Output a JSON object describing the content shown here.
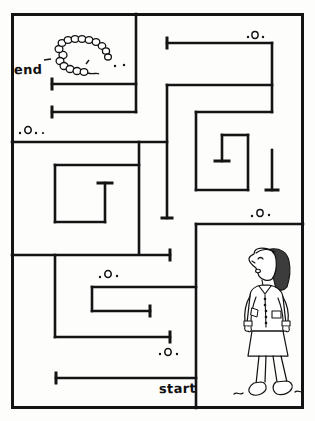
{
  "puzzle": {
    "type": "maze",
    "title": "Maze puzzle with girl and caterpillar",
    "labels": {
      "start": "start",
      "end": "end"
    },
    "colors": {
      "ink": "#141414",
      "paper": "#fdfdfc",
      "wall": "#111111"
    },
    "frame": {
      "x": 11,
      "y": 13,
      "width": 292,
      "height": 395,
      "stroke": 3
    },
    "figures": [
      {
        "name": "caterpillar",
        "description": "caterpillar drawn as a chain of small circles, top-left cell"
      },
      {
        "name": "girl",
        "description": "girl in jacket and skirt looking upward, bottom-right cell"
      }
    ],
    "pebbles": [
      {
        "name": "pebble-top-right",
        "x": 248,
        "y": 38,
        "glyph": ".o."
      },
      {
        "name": "pebble-left-upper",
        "x": 18,
        "y": 131,
        "glyph": ".o.."
      },
      {
        "name": "pebble-right-middle",
        "x": 248,
        "y": 215,
        "glyph": ".o."
      },
      {
        "name": "pebble-center-lower",
        "x": 97,
        "y": 274,
        "glyph": ".o."
      },
      {
        "name": "pebble-bottom-center",
        "x": 157,
        "y": 352,
        "glyph": ".o."
      },
      {
        "name": "pebble-caterpillar-trail",
        "x": 110,
        "y": 57,
        "glyph": ". ."
      }
    ],
    "walls": {
      "horizontal": [
        {
          "x1": 52,
          "x2": 136,
          "y": 84
        },
        {
          "x1": 136,
          "x2": 167,
          "y": 84
        },
        {
          "x1": 52,
          "x2": 136,
          "y": 112
        },
        {
          "x1": 11,
          "x2": 167,
          "y": 142
        },
        {
          "x1": 167,
          "x2": 272,
          "y": 43
        },
        {
          "x1": 167,
          "x2": 272,
          "y": 85
        },
        {
          "x1": 196,
          "x2": 272,
          "y": 112
        },
        {
          "x1": 196,
          "x2": 248,
          "y": 190
        },
        {
          "x1": 55,
          "x2": 105,
          "y": 165
        },
        {
          "x1": 55,
          "x2": 105,
          "y": 222
        },
        {
          "x1": 11,
          "x2": 170,
          "y": 255
        },
        {
          "x1": 196,
          "x2": 303,
          "y": 224
        },
        {
          "x1": 92,
          "x2": 196,
          "y": 287
        },
        {
          "x1": 92,
          "x2": 150,
          "y": 311
        },
        {
          "x1": 55,
          "x2": 170,
          "y": 337
        },
        {
          "x1": 44,
          "x2": 196,
          "y": 378
        }
      ],
      "vertical": [
        {
          "y1": 13,
          "y2": 84,
          "x": 136
        },
        {
          "y1": 13,
          "y2": 112,
          "x": 136
        },
        {
          "y1": 85,
          "y2": 142,
          "x": 167
        },
        {
          "y1": 142,
          "y2": 222,
          "x": 167
        },
        {
          "y1": 43,
          "y2": 112,
          "x": 272
        },
        {
          "y1": 112,
          "y2": 190,
          "x": 248
        },
        {
          "y1": 112,
          "y2": 190,
          "x": 196
        },
        {
          "y1": 165,
          "y2": 222,
          "x": 55
        },
        {
          "y1": 165,
          "y2": 222,
          "x": 105
        },
        {
          "y1": 255,
          "y2": 337,
          "x": 55
        },
        {
          "y1": 224,
          "y2": 408,
          "x": 196
        },
        {
          "y1": 287,
          "y2": 311,
          "x": 92
        }
      ]
    }
  }
}
